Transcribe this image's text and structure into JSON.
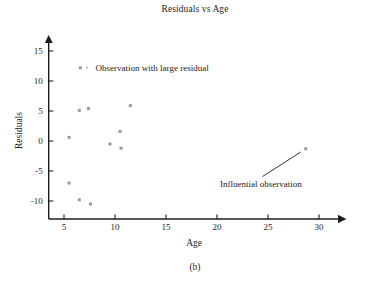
{
  "figure": {
    "caption": "(b)"
  },
  "chart_data": {
    "type": "scatter",
    "title": "Residuals vs Age",
    "xlabel": "Age",
    "ylabel": "Residuals",
    "xlim": [
      3.5,
      32
    ],
    "ylim": [
      -13,
      16.5
    ],
    "xticks": [
      5,
      10,
      15,
      20,
      25,
      30
    ],
    "xtick_labels": [
      "5",
      "10",
      "15",
      "20",
      "25",
      "30"
    ],
    "yticks": [
      -10,
      -5,
      0,
      5,
      10,
      15
    ],
    "ytick_labels": [
      "-10",
      "-5",
      "0",
      "5",
      "10",
      "15"
    ],
    "grid": false,
    "legend": "none",
    "marker": {
      "shape": "square",
      "color": "#9a9a9a",
      "size": 3
    },
    "axis_color": "#1c1c1c",
    "x": [
      6.6,
      5.5,
      6.5,
      7.4,
      11.5,
      10.5,
      9.5,
      10.6,
      5.5,
      6.5,
      7.6,
      28.7
    ],
    "y": [
      12.2,
      0.6,
      5.1,
      5.4,
      5.9,
      1.6,
      -0.5,
      -1.2,
      -7.0,
      -9.8,
      -10.5,
      -1.3
    ],
    "points": [
      {
        "x": 6.6,
        "y": 12.2,
        "note": "Observation with large residual"
      },
      {
        "x": 5.5,
        "y": 0.6,
        "note": ""
      },
      {
        "x": 6.5,
        "y": 5.1,
        "note": ""
      },
      {
        "x": 7.4,
        "y": 5.4,
        "note": ""
      },
      {
        "x": 11.5,
        "y": 5.9,
        "note": ""
      },
      {
        "x": 10.5,
        "y": 1.6,
        "note": ""
      },
      {
        "x": 9.5,
        "y": -0.5,
        "note": ""
      },
      {
        "x": 10.6,
        "y": -1.2,
        "note": ""
      },
      {
        "x": 5.5,
        "y": -7.0,
        "note": ""
      },
      {
        "x": 6.5,
        "y": -9.8,
        "note": ""
      },
      {
        "x": 7.6,
        "y": -10.5,
        "note": ""
      },
      {
        "x": 28.7,
        "y": -1.3,
        "note": "Influential observation"
      }
    ],
    "annotations": [
      {
        "text": "Observation with large residual",
        "target_x": 6.6,
        "target_y": 12.2,
        "text_x": 7.9,
        "text_y": 12.2,
        "anchor": "start"
      },
      {
        "text": "Influential observation",
        "target_x": 28.7,
        "target_y": -1.3,
        "text_x": 24.3,
        "text_y": -6.1,
        "anchor": "middle"
      }
    ]
  }
}
